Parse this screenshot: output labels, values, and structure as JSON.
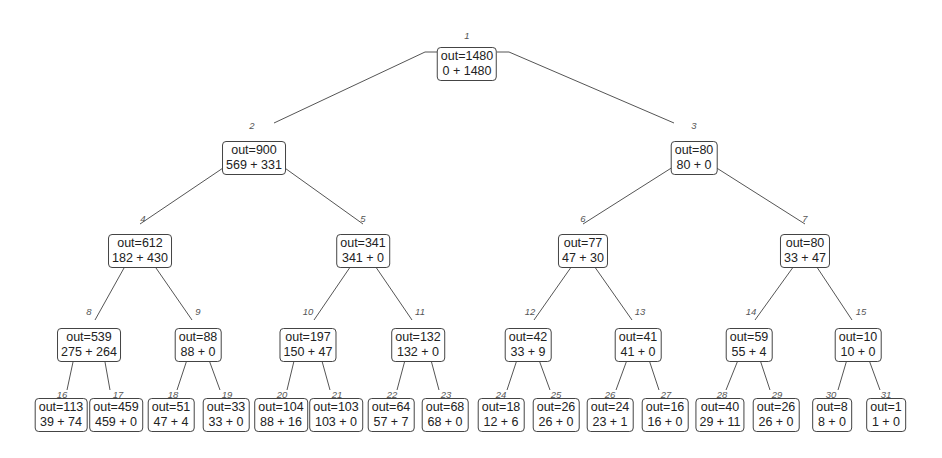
{
  "nodes": [
    {
      "id": "1",
      "out": "out=1480",
      "split": "0 + 1480"
    },
    {
      "id": "2",
      "out": "out=900",
      "split": "569 + 331"
    },
    {
      "id": "3",
      "out": "out=80",
      "split": "80 + 0"
    },
    {
      "id": "4",
      "out": "out=612",
      "split": "182 + 430"
    },
    {
      "id": "5",
      "out": "out=341",
      "split": "341 + 0"
    },
    {
      "id": "6",
      "out": "out=77",
      "split": "47 + 30"
    },
    {
      "id": "7",
      "out": "out=80",
      "split": "33 + 47"
    },
    {
      "id": "8",
      "out": "out=539",
      "split": "275 + 264"
    },
    {
      "id": "9",
      "out": "out=88",
      "split": "88 + 0"
    },
    {
      "id": "10",
      "out": "out=197",
      "split": "150 + 47"
    },
    {
      "id": "11",
      "out": "out=132",
      "split": "132 + 0"
    },
    {
      "id": "12",
      "out": "out=42",
      "split": "33 + 9"
    },
    {
      "id": "13",
      "out": "out=41",
      "split": "41 + 0"
    },
    {
      "id": "14",
      "out": "out=59",
      "split": "55 + 4"
    },
    {
      "id": "15",
      "out": "out=10",
      "split": "10 + 0"
    },
    {
      "id": "16",
      "out": "out=113",
      "split": "39 + 74"
    },
    {
      "id": "17",
      "out": "out=459",
      "split": "459 + 0"
    },
    {
      "id": "18",
      "out": "out=51",
      "split": "47 + 4"
    },
    {
      "id": "19",
      "out": "out=33",
      "split": "33 + 0"
    },
    {
      "id": "20",
      "out": "out=104",
      "split": "88 + 16"
    },
    {
      "id": "21",
      "out": "out=103",
      "split": "103 + 0"
    },
    {
      "id": "22",
      "out": "out=64",
      "split": "57 + 7"
    },
    {
      "id": "23",
      "out": "out=68",
      "split": "68 + 0"
    },
    {
      "id": "24",
      "out": "out=18",
      "split": "12 + 6"
    },
    {
      "id": "25",
      "out": "out=26",
      "split": "26 + 0"
    },
    {
      "id": "26",
      "out": "out=24",
      "split": "23 + 1"
    },
    {
      "id": "27",
      "out": "out=16",
      "split": "16 + 0"
    },
    {
      "id": "28",
      "out": "out=40",
      "split": "29 + 11"
    },
    {
      "id": "29",
      "out": "out=26",
      "split": "26 + 0"
    },
    {
      "id": "30",
      "out": "out=8",
      "split": "8 + 0"
    },
    {
      "id": "31",
      "out": "out=1",
      "split": "1 + 0"
    }
  ],
  "edges": [
    [
      "1",
      "2"
    ],
    [
      "1",
      "3"
    ],
    [
      "2",
      "4"
    ],
    [
      "2",
      "5"
    ],
    [
      "3",
      "6"
    ],
    [
      "3",
      "7"
    ],
    [
      "4",
      "8"
    ],
    [
      "4",
      "9"
    ],
    [
      "5",
      "10"
    ],
    [
      "5",
      "11"
    ],
    [
      "6",
      "12"
    ],
    [
      "6",
      "13"
    ],
    [
      "7",
      "14"
    ],
    [
      "7",
      "15"
    ],
    [
      "8",
      "16"
    ],
    [
      "8",
      "17"
    ],
    [
      "9",
      "18"
    ],
    [
      "9",
      "19"
    ],
    [
      "10",
      "20"
    ],
    [
      "10",
      "21"
    ],
    [
      "11",
      "22"
    ],
    [
      "11",
      "23"
    ],
    [
      "12",
      "24"
    ],
    [
      "12",
      "25"
    ],
    [
      "13",
      "26"
    ],
    [
      "13",
      "27"
    ],
    [
      "14",
      "28"
    ],
    [
      "14",
      "29"
    ],
    [
      "15",
      "30"
    ],
    [
      "15",
      "31"
    ]
  ],
  "colors": {
    "border": "#444444",
    "edge": "#555555",
    "label": "#555555",
    "text": "#222222"
  }
}
